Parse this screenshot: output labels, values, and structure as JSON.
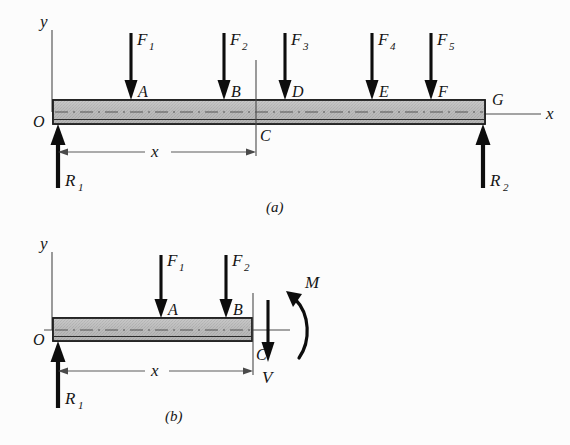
{
  "figure": {
    "background_color": "#fcfcfc",
    "ink_color": "#0d0d0d",
    "beam_fill_color": "#b9b9b9",
    "panels": [
      {
        "id": "a",
        "caption": "(a)"
      },
      {
        "id": "b",
        "caption": "(b)"
      }
    ]
  },
  "panel_a": {
    "caption": "(a)",
    "axes": {
      "y_label": "y",
      "x_label": "x",
      "origin_label": "O"
    },
    "forces": [
      {
        "name": "F1",
        "label": "F",
        "sub": "1",
        "point": "A"
      },
      {
        "name": "F2",
        "label": "F",
        "sub": "2",
        "point": "B"
      },
      {
        "name": "F3",
        "label": "F",
        "sub": "3",
        "point": "D"
      },
      {
        "name": "F4",
        "label": "F",
        "sub": "4",
        "point": "E"
      },
      {
        "name": "F5",
        "label": "F",
        "sub": "5",
        "point": "F"
      }
    ],
    "point_labels": [
      "A",
      "B",
      "D",
      "E",
      "F",
      "G"
    ],
    "reactions": [
      {
        "name": "R1",
        "label": "R",
        "sub": "1",
        "direction": "up"
      },
      {
        "name": "R2",
        "label": "R",
        "sub": "2",
        "direction": "up"
      }
    ],
    "section": {
      "cut_label": "C",
      "dimension_label": "x"
    }
  },
  "panel_b": {
    "caption": "(b)",
    "axes": {
      "y_label": "y",
      "x_label": "x",
      "origin_label": "O"
    },
    "forces": [
      {
        "name": "F1",
        "label": "F",
        "sub": "1",
        "point": "A"
      },
      {
        "name": "F2",
        "label": "F",
        "sub": "2",
        "point": "B"
      }
    ],
    "point_labels": [
      "A",
      "B",
      "C"
    ],
    "reactions": [
      {
        "name": "R1",
        "label": "R",
        "sub": "1",
        "direction": "up"
      }
    ],
    "internal": {
      "shear_label": "V",
      "moment_label": "M"
    },
    "section": {
      "cut_label": "C",
      "dimension_label": "x"
    }
  }
}
